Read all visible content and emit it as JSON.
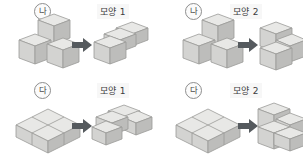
{
  "worksheet": {
    "title": "",
    "columns": 2,
    "rows": 2,
    "arrow_icon": "right-arrow-icon",
    "colors": {
      "cube_top": "#e8e8e6",
      "cube_left": "#d3d3d1",
      "cube_right": "#bdbdbb",
      "cube_outline": "#9a9a98",
      "arrow": "#555a5e",
      "text": "#3c3c3c",
      "background": "#ffffff"
    }
  },
  "panels": [
    {
      "id": "panel-1",
      "piece_label": "나",
      "shape_caption": "모양 1",
      "source_shape": "three-cube-L-upright",
      "target_shape": "three-cube-L-flat"
    },
    {
      "id": "panel-2",
      "piece_label": "나",
      "shape_caption": "모양 2",
      "source_shape": "three-cube-L-upright",
      "target_shape": "three-cube-stair"
    },
    {
      "id": "panel-3",
      "piece_label": "다",
      "shape_caption": "모양 1",
      "source_shape": "four-cube-square-slab",
      "target_shape": "four-cube-zigzag-flat"
    },
    {
      "id": "panel-4",
      "piece_label": "다",
      "shape_caption": "모양 2",
      "source_shape": "four-cube-square-slab",
      "target_shape": "four-cube-stair"
    }
  ]
}
